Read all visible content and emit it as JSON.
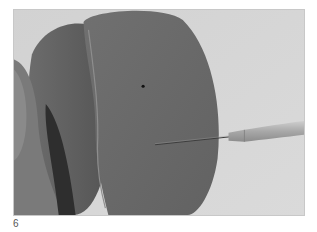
{
  "figure": {
    "number": "6",
    "image_description": "Grayscale photograph: a hand holding a dark rubber-like disc-shaped object while a fine needle/awl with a textured metal handle pierces its surface; a small dark dot is visible on the disc.",
    "colors": {
      "background": "#d6d6d6",
      "object": "#6a6a6a",
      "object_shadow": "#3a3a3a",
      "hand": "#7a7a7a",
      "tool_handle": "#b4b4b4",
      "needle": "#4a4a4a",
      "caption": "#555555"
    }
  }
}
